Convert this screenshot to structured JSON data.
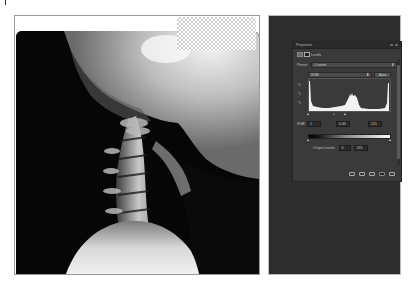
{
  "canvas": {
    "image_subject": "lateral cervical spine x-ray",
    "transparent_region": "checkerboard"
  },
  "properties_panel": {
    "title": "Properties",
    "adjustment_name": "Levels",
    "preset_label": "Preset:",
    "preset_value": "Custom",
    "channel_value": "RGB",
    "auto_label": "Auto",
    "input_label": "RGB",
    "input_levels": [
      "1",
      "0.45",
      "221"
    ],
    "output_levels_label": "Output Levels:",
    "output_levels": [
      "0",
      "255"
    ],
    "eyedroppers": [
      "black-point-eyedropper",
      "gray-point-eyedropper",
      "white-point-eyedropper"
    ],
    "footer_icons": [
      "clip-to-layer-icon",
      "view-previous-icon",
      "reset-icon",
      "visibility-icon",
      "trash-icon"
    ]
  },
  "colors": {
    "workspace_bg": "#2d2d2d",
    "panel_bg": "#3a3a3a",
    "frame_border": "#9a9a9a"
  }
}
